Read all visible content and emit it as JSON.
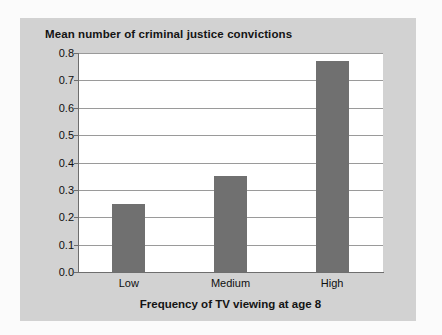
{
  "chart_data": {
    "type": "bar",
    "title": "Mean number of criminal justice convictions",
    "xlabel": "Frequency of TV viewing at age 8",
    "ylabel": "",
    "categories": [
      "Low",
      "Medium",
      "High"
    ],
    "values": [
      0.25,
      0.35,
      0.77
    ],
    "ylim": [
      0.0,
      0.8
    ],
    "ytick_labels": [
      "0.8",
      "0.7",
      "0.6",
      "0.5",
      "0.4",
      "0.3",
      "0.2",
      "0.1",
      "0.0"
    ],
    "ytick_values": [
      0.8,
      0.7,
      0.6,
      0.5,
      0.4,
      0.3,
      0.2,
      0.1,
      0.0
    ],
    "grid": true,
    "legend": false,
    "bar_color": "#707070",
    "plot_background": "#ffffff",
    "card_background": "#d2d2d2",
    "page_background": "#fbfbfb"
  }
}
